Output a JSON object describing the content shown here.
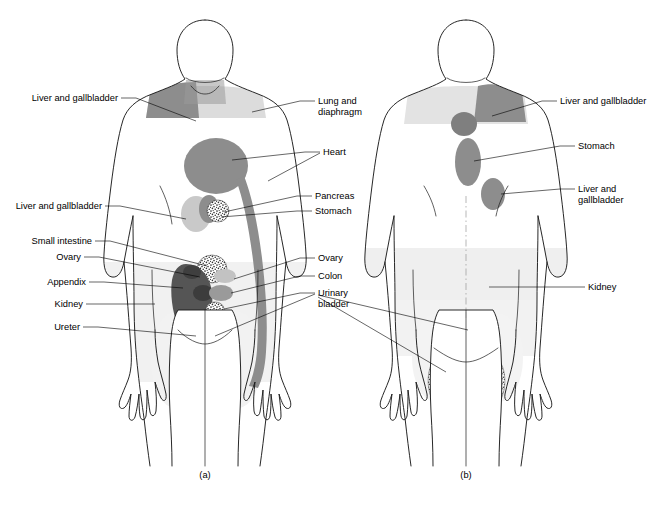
{
  "figure": {
    "captions": [
      {
        "id": "a",
        "text": "(a)",
        "view": "anterior",
        "x": 205,
        "y": 478
      },
      {
        "id": "b",
        "text": "(b)",
        "view": "posterior",
        "x": 466,
        "y": 478
      }
    ],
    "background_color": "#ffffff",
    "outline_color": "#1b1b1b"
  },
  "palette": {
    "pale_body_shade": "#eeeeee",
    "light_gray": "#d4d4d4",
    "medium_gray": "#8d8d8d",
    "dark_gray": "#555555",
    "stipple_dark": "#3a3a3a",
    "label_text": "#000000"
  },
  "panel_a": {
    "caption": "(a)",
    "labels_left": [
      {
        "key": "liver_gallbladder_shoulder",
        "text": "Liver and gallbladder",
        "x": 118,
        "y": 101,
        "line": [
          [
            121,
            98
          ],
          [
            136,
            98
          ],
          [
            196,
            121
          ]
        ]
      },
      {
        "key": "liver_gallbladder_upper_abdomen",
        "text": "Liver and gallbladder",
        "x": 102,
        "y": 209,
        "line": [
          [
            105,
            206
          ],
          [
            120,
            206
          ],
          [
            186,
            219
          ]
        ]
      },
      {
        "key": "small_intestine",
        "text": "Small intestine",
        "x": 92,
        "y": 244,
        "line": [
          [
            95,
            241
          ],
          [
            110,
            241
          ],
          [
            207,
            266
          ]
        ]
      },
      {
        "key": "ovary_left",
        "text": "Ovary",
        "x": 81,
        "y": 260,
        "line": [
          [
            84,
            257
          ],
          [
            99,
            257
          ],
          [
            200,
            277
          ]
        ]
      },
      {
        "key": "appendix",
        "text": "Appendix",
        "x": 86,
        "y": 285,
        "line": [
          [
            89,
            282
          ],
          [
            104,
            282
          ],
          [
            183,
            288
          ]
        ]
      },
      {
        "key": "kidney_left",
        "text": "Kidney",
        "x": 83,
        "y": 307,
        "line": [
          [
            86,
            304
          ],
          [
            101,
            304
          ],
          [
            155,
            304
          ]
        ]
      },
      {
        "key": "ureter",
        "text": "Ureter",
        "x": 80,
        "y": 330,
        "line": [
          [
            83,
            327
          ],
          [
            98,
            327
          ],
          [
            196,
            336
          ]
        ]
      }
    ],
    "labels_right": [
      {
        "key": "lung_diaphragm",
        "text": "Lung and",
        "text2": "diaphragm",
        "x": 318,
        "y": 104,
        "line": [
          [
            315,
            101
          ],
          [
            300,
            101
          ],
          [
            252,
            112
          ]
        ]
      },
      {
        "key": "heart",
        "text": "Heart",
        "x": 323,
        "y": 155,
        "line": [
          [
            320,
            152
          ],
          [
            305,
            152
          ],
          [
            232,
            160
          ]
        ]
      },
      {
        "key": "heart_arm",
        "text": "",
        "line": [
          [
            320,
            153
          ],
          [
            268,
            180
          ]
        ]
      },
      {
        "key": "pancreas",
        "text": "Pancreas",
        "x": 315,
        "y": 199,
        "line": [
          [
            312,
            196
          ],
          [
            297,
            196
          ],
          [
            224,
            212
          ]
        ]
      },
      {
        "key": "stomach",
        "text": "Stomach",
        "x": 315,
        "y": 214,
        "line": [
          [
            312,
            211
          ],
          [
            297,
            211
          ],
          [
            221,
            216
          ]
        ]
      },
      {
        "key": "ovary_right",
        "text": "Ovary",
        "x": 318,
        "y": 261,
        "line": [
          [
            315,
            258
          ],
          [
            300,
            258
          ],
          [
            232,
            281
          ]
        ]
      },
      {
        "key": "colon",
        "text": "Colon",
        "x": 318,
        "y": 279,
        "line": [
          [
            315,
            276
          ],
          [
            300,
            276
          ],
          [
            229,
            293
          ]
        ]
      },
      {
        "key": "urinary_bladder",
        "text": "Urinary",
        "text2": "bladder",
        "x": 318,
        "y": 296,
        "line": [
          [
            315,
            293
          ],
          [
            300,
            293
          ],
          [
            226,
            308
          ]
        ]
      },
      {
        "key": "urinary_bladder_2",
        "text": "",
        "line": [
          [
            315,
            294
          ],
          [
            214,
            336
          ]
        ]
      }
    ],
    "regions": [
      {
        "key": "neck_shoulder-liver-patch",
        "organ": "Liver and gallbladder",
        "tone": "medium_gray"
      },
      {
        "key": "neck-lung-diaphragm-patch",
        "organ": "Lung and diaphragm",
        "tone": "light_gray"
      },
      {
        "key": "heart-chest-blob",
        "organ": "Heart",
        "tone": "medium_gray"
      },
      {
        "key": "heart-arm-band",
        "organ": "Heart (arm referral)",
        "tone": "medium_gray"
      },
      {
        "key": "liver-epigastric",
        "organ": "Liver and gallbladder",
        "tone": "light_gray"
      },
      {
        "key": "pancreas-epigastric",
        "organ": "Pancreas",
        "tone": "medium_gray"
      },
      {
        "key": "stomach-stipple",
        "organ": "Stomach",
        "tone": "stipple"
      },
      {
        "key": "small-intestine-stipple",
        "organ": "Small intestine",
        "tone": "stipple"
      },
      {
        "key": "appendix-kidney-mass",
        "organ": "Appendix / Kidney",
        "tone": "dark_gray"
      },
      {
        "key": "ovary-right-oval",
        "organ": "Ovary",
        "tone": "light_gray"
      },
      {
        "key": "colon-oval",
        "organ": "Colon",
        "tone": "medium_gray"
      },
      {
        "key": "ureter-stipple",
        "organ": "Ureter",
        "tone": "stipple"
      },
      {
        "key": "bladder-stipple",
        "organ": "Urinary bladder",
        "tone": "stipple"
      }
    ]
  },
  "panel_b": {
    "caption": "(b)",
    "labels_right": [
      {
        "key": "liver_gallbladder_shoulder_b",
        "text": "Liver and gallbladder",
        "x": 560,
        "y": 104,
        "line": [
          [
            557,
            101
          ],
          [
            542,
            101
          ],
          [
            490,
            116
          ]
        ]
      },
      {
        "key": "stomach_b",
        "text": "Stomach",
        "x": 578,
        "y": 149,
        "line": [
          [
            575,
            146
          ],
          [
            560,
            146
          ],
          [
            474,
            160
          ]
        ]
      },
      {
        "key": "liver_gallbladder_flank_b",
        "text": "Liver and",
        "text2": "gallbladder",
        "x": 578,
        "y": 192,
        "line": [
          [
            575,
            189
          ],
          [
            560,
            189
          ],
          [
            500,
            194
          ]
        ]
      },
      {
        "key": "kidney_b",
        "text": "Kidney",
        "x": 588,
        "y": 290,
        "line": [
          [
            585,
            287
          ],
          [
            570,
            287
          ],
          [
            489,
            287
          ]
        ]
      }
    ],
    "regions": [
      {
        "key": "upper-back-lung-shade",
        "organ": "Lung and diaphragm",
        "tone": "light_gray"
      },
      {
        "key": "shoulder-liver-patch-b",
        "organ": "Liver and gallbladder",
        "tone": "medium_gray"
      },
      {
        "key": "heart-circle-b",
        "organ": "Heart",
        "tone": "medium_gray"
      },
      {
        "key": "stomach-oval-b",
        "organ": "Stomach",
        "tone": "medium_gray"
      },
      {
        "key": "liver-flank-patch-b",
        "organ": "Liver and gallbladder",
        "tone": "medium_gray"
      },
      {
        "key": "lumbar-kidney-shade",
        "organ": "Kidney",
        "tone": "pale"
      },
      {
        "key": "sacral-bladder-stipple",
        "organ": "Urinary bladder",
        "tone": "stipple"
      },
      {
        "key": "buttock-left-stipple",
        "organ": "Urinary bladder",
        "tone": "stipple"
      },
      {
        "key": "buttock-right-stipple",
        "organ": "Urinary bladder",
        "tone": "stipple"
      }
    ]
  }
}
